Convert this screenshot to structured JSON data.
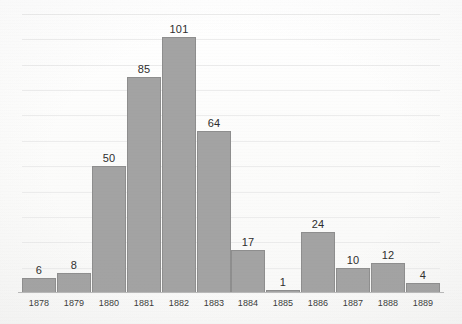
{
  "chart_data": {
    "type": "bar",
    "title": "",
    "subtitle": "",
    "xlabel": "",
    "ylabel": "",
    "categories": [
      "1878",
      "1879",
      "1880",
      "1881",
      "1882",
      "1883",
      "1884",
      "1885",
      "1886",
      "1887",
      "1888",
      "1889"
    ],
    "values": [
      6,
      8,
      50,
      85,
      101,
      64,
      17,
      1,
      24,
      10,
      12,
      4
    ],
    "data_labels": [
      "6",
      "8",
      "50",
      "85",
      "101",
      "64",
      "17",
      "1",
      "24",
      "10",
      "12",
      "4"
    ],
    "ylim": [
      0,
      110
    ],
    "y_tick_labels": [],
    "grid": {
      "horizontal": true,
      "vertical": false,
      "interval": 10,
      "count": 11
    },
    "legend": {
      "visible": false,
      "entries": []
    },
    "axis": {
      "x_axis_line": true,
      "y_axis_line": false
    },
    "colors": {
      "bar_fill": "#a3a3a3",
      "bar_border": "#8e8e8e",
      "gridline": "#ececec",
      "axis_line": "#b9b9b9",
      "data_label_text": "#2e2e2e",
      "tick_label_text": "#3a3a3a",
      "background": "#fdfdfd"
    }
  }
}
